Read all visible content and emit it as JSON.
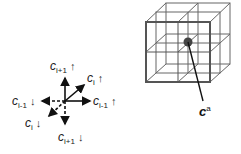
{
  "left_diagram": {
    "labels": [
      {
        "id": "up",
        "base": "c",
        "sub": "i+1",
        "arrow": "↑"
      },
      {
        "id": "diag_up",
        "base": "c",
        "sub": "i",
        "arrow": "↑"
      },
      {
        "id": "left",
        "base": "c",
        "sub": "i-1",
        "arrow": "↓"
      },
      {
        "id": "right",
        "base": "c",
        "sub": "i-1",
        "arrow": "↑"
      },
      {
        "id": "diag_down",
        "base": "c",
        "sub": "i",
        "arrow": "↓"
      },
      {
        "id": "down",
        "base": "c",
        "sub": "i+1",
        "arrow": "↓"
      }
    ]
  },
  "right_diagram": {
    "label_base": "c",
    "label_sup": "a"
  }
}
